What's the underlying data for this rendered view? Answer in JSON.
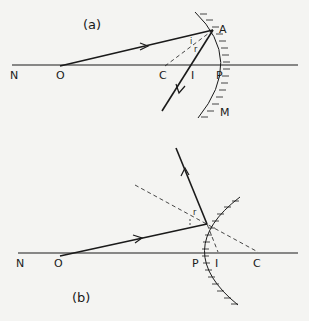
{
  "diagram_a": {
    "caption": "(a)",
    "description": "Concave mirror: ray from O reflects at A back through I; C is the centre of curvature",
    "labels": {
      "N": "N",
      "O": "O",
      "C": "C",
      "I": "I",
      "P": "P",
      "A": "A",
      "M": "M",
      "angle_i": "i",
      "angle_r": "r"
    }
  },
  "diagram_b": {
    "caption": "(b)",
    "description": "Convex mirror: ray from O reflects upward; virtual image I lies between P and C",
    "labels": {
      "N": "N",
      "O": "O",
      "P": "P",
      "I": "I",
      "C": "C",
      "angle_i": "i",
      "angle_r": "r"
    }
  },
  "colors": {
    "line": "#1a1a1a",
    "background": "#f4f4f2"
  }
}
